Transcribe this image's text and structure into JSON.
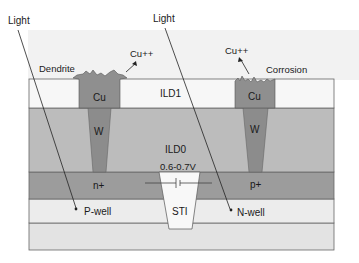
{
  "diagram": {
    "type": "semiconductor-cross-section",
    "labels": {
      "light_left": "Light",
      "light_right": "Light",
      "dendrite": "Dendrite",
      "corrosion": "Corrosion",
      "cu_ion_left": "Cu++",
      "cu_ion_right": "Cu++",
      "ild1": "ILD1",
      "ild0": "ILD0",
      "cu_left": "Cu",
      "cu_right": "Cu",
      "w_left": "W",
      "w_right": "W",
      "n_plus": "n+",
      "p_plus": "p+",
      "voltage": "0.6-0.7V",
      "sti": "STI",
      "p_well": "P-well",
      "n_well": "N-well"
    },
    "colors": {
      "background_haze": "#f1f1f1",
      "ild1": "#f6f6f6",
      "ild0": "#b9b9b9",
      "cu": "#8e8e8e",
      "w": "#8a8a8a",
      "diffusion": "#999999",
      "well": "#e8e8e8",
      "substrate": "#e2e2e2",
      "sti": "#f7f7f7",
      "outline": "#555555"
    }
  }
}
